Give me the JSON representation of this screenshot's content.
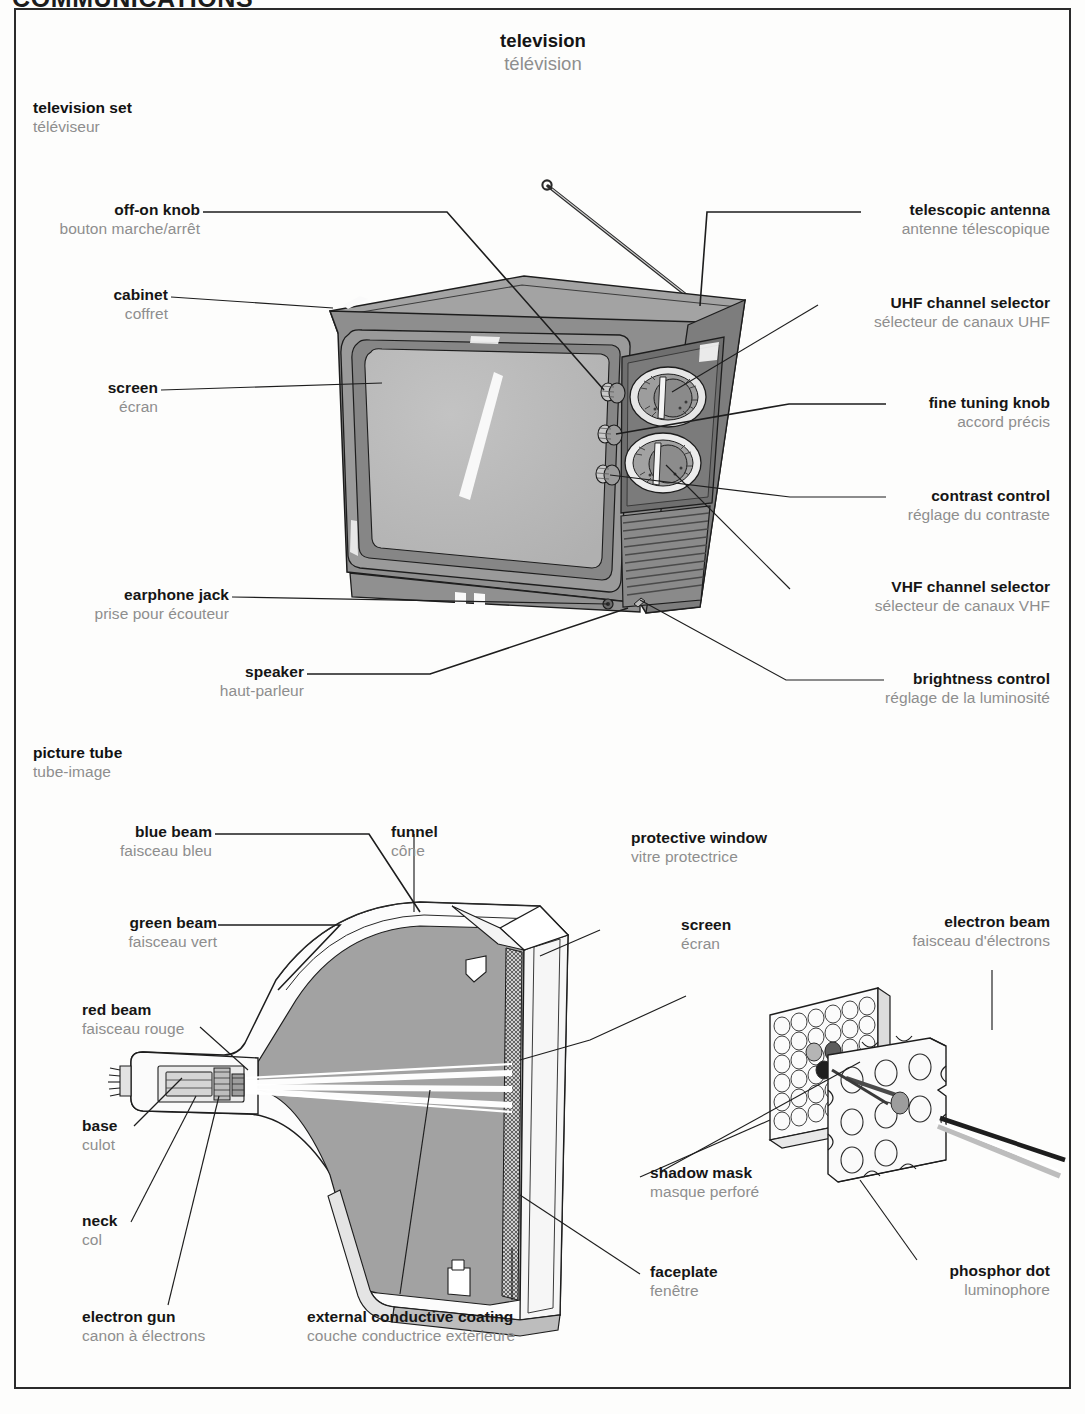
{
  "chapter": "COMMUNICATIONS",
  "page_title": {
    "en": "television",
    "fr": "télévision"
  },
  "sections": [
    {
      "id": "television-set",
      "en": "television set",
      "fr": "téléviseur"
    },
    {
      "id": "picture-tube",
      "en": "picture tube",
      "fr": "tube-image"
    }
  ],
  "television_set_labels": {
    "off_on_knob": {
      "en": "off-on knob",
      "fr": "bouton marche/arrêt"
    },
    "cabinet": {
      "en": "cabinet",
      "fr": "coffret"
    },
    "screen": {
      "en": "screen",
      "fr": "écran"
    },
    "earphone_jack": {
      "en": "earphone jack",
      "fr": "prise pour écouteur"
    },
    "speaker": {
      "en": "speaker",
      "fr": "haut-parleur"
    },
    "telescopic_antenna": {
      "en": "telescopic antenna",
      "fr": "antenne télescopique"
    },
    "uhf_channel_selector": {
      "en": "UHF channel selector",
      "fr": "sélecteur de canaux UHF"
    },
    "fine_tuning_knob": {
      "en": "fine tuning knob",
      "fr": "accord précis"
    },
    "contrast_control": {
      "en": "contrast control",
      "fr": "réglage du contraste"
    },
    "vhf_channel_selector": {
      "en": "VHF channel selector",
      "fr": "sélecteur de canaux VHF"
    },
    "brightness_control": {
      "en": "brightness control",
      "fr": "réglage de la luminosité"
    }
  },
  "picture_tube_labels": {
    "blue_beam": {
      "en": "blue beam",
      "fr": "faisceau bleu"
    },
    "green_beam": {
      "en": "green beam",
      "fr": "faisceau vert"
    },
    "red_beam": {
      "en": "red beam",
      "fr": "faisceau rouge"
    },
    "base": {
      "en": "base",
      "fr": "culot"
    },
    "neck": {
      "en": "neck",
      "fr": "col"
    },
    "electron_gun": {
      "en": "electron gun",
      "fr": "canon à électrons"
    },
    "external_conductive_coating": {
      "en": "external conductive coating",
      "fr": "couche conductrice extérieure"
    },
    "funnel": {
      "en": "funnel",
      "fr": "cône"
    },
    "protective_window": {
      "en": "protective window",
      "fr": "vitre protectrice"
    },
    "screen": {
      "en": "screen",
      "fr": "écran"
    },
    "shadow_mask": {
      "en": "shadow mask",
      "fr": "masque perforé"
    },
    "faceplate": {
      "en": "faceplate",
      "fr": "fenêtre"
    },
    "electron_beam": {
      "en": "electron beam",
      "fr": "faisceau d'électrons"
    },
    "phosphor_dot": {
      "en": "phosphor dot",
      "fr": "luminophore"
    }
  },
  "colors": {
    "english_text": "#151515",
    "french_text": "#8e8e8e",
    "leader_line": "#1d1d1d",
    "frame": "#2b2b2b",
    "cabinet_fill": "#8e8e8e",
    "cabinet_top": "#9b9b9b",
    "screen_fill": "#b7b7b7",
    "tube_fill": "#a2a2a2",
    "page_background": "#fdfdfc"
  }
}
